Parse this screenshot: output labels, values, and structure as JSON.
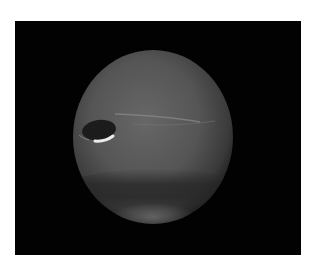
{
  "image": {
    "subject": "Neptune",
    "description": "Grayscale photograph of the planet Neptune on a black background showing a dark oval spot with bright companion cloud and banded atmosphere",
    "colors": {
      "background": "#ffffff",
      "frame": "#020202",
      "planet_light": "#6a6a6a",
      "planet_dark": "#2e2e2e",
      "spot": "#1c1c1c",
      "cloud": "#e8e8e8"
    }
  }
}
